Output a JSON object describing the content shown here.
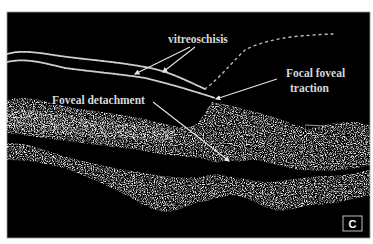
{
  "figure": {
    "type": "OCT retinal scan",
    "panel_label": "C",
    "background_color": "#000000",
    "tissue_color": "#cfcfcf",
    "annotation_color": "#d8d8d8"
  },
  "annotations": [
    {
      "id": "vitreoschisis",
      "text": "vitreoschisis"
    },
    {
      "id": "focal-foveal-traction",
      "line1": "Focal foveal",
      "line2": "traction"
    },
    {
      "id": "foveal-detachment",
      "text": "Foveal detachment"
    }
  ]
}
